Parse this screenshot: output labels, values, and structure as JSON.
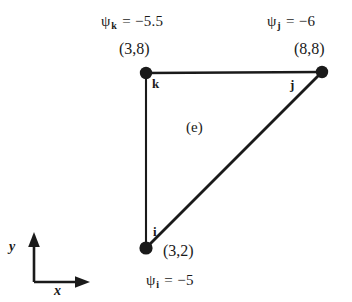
{
  "figure": {
    "background_color": "#ffffff",
    "stroke_color": "#1a1a1a",
    "element_label": "(e)"
  },
  "axes": {
    "y_label": "y",
    "x_label": "x",
    "origin_px": [
      34,
      282
    ],
    "x_arrow_end_px": [
      88,
      282
    ],
    "y_arrow_end_px": [
      34,
      234
    ]
  },
  "nodes": [
    {
      "id": "i",
      "letter": "i",
      "coordinate_text": "(3,2)",
      "x": 3,
      "y": 2,
      "potential_text": "ψ",
      "potential_sub": "i",
      "potential_value_text": "= −5",
      "potential_value": -5,
      "px": [
        146,
        248
      ]
    },
    {
      "id": "j",
      "letter": "j",
      "coordinate_text": "(8,8)",
      "x": 8,
      "y": 8,
      "potential_text": "ψ",
      "potential_sub": "j",
      "potential_value_text": "= −6",
      "potential_value": -6,
      "px": [
        322,
        72
      ]
    },
    {
      "id": "k",
      "letter": "k",
      "coordinate_text": "(3,8)",
      "x": 3,
      "y": 8,
      "potential_text": "ψ",
      "potential_sub": "k",
      "potential_value_text": "= −5.5",
      "potential_value": -5.5,
      "px": [
        146,
        73
      ]
    }
  ],
  "edges": [
    {
      "from": "k",
      "to": "j",
      "name": "edge-k-j"
    },
    {
      "from": "j",
      "to": "i",
      "name": "edge-j-i"
    },
    {
      "from": "i",
      "to": "k",
      "name": "edge-i-k"
    }
  ]
}
